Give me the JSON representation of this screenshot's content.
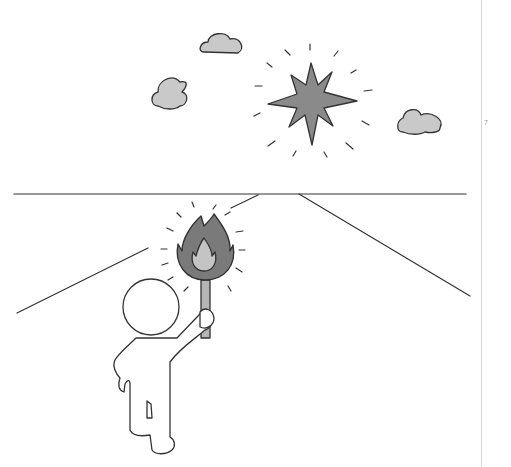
{
  "page": {
    "number": "7"
  },
  "colors": {
    "ink": "#333333",
    "star_fill": "#8a8a8a",
    "cloud_fill": "#c9c9c9",
    "flame_outer": "#7a7a7a",
    "flame_inner": "#c4c4c4",
    "torch_stick": "#b5b5b5",
    "rule": "#d6d6d6"
  },
  "scene": {
    "description": "Stick figure holding a lit torch on a road toward the horizon; a bright star and clouds in the sky",
    "elements": [
      "star",
      "cloud-left",
      "cloud-top",
      "cloud-right",
      "horizon",
      "road-left",
      "road-right",
      "torch",
      "figure"
    ]
  }
}
